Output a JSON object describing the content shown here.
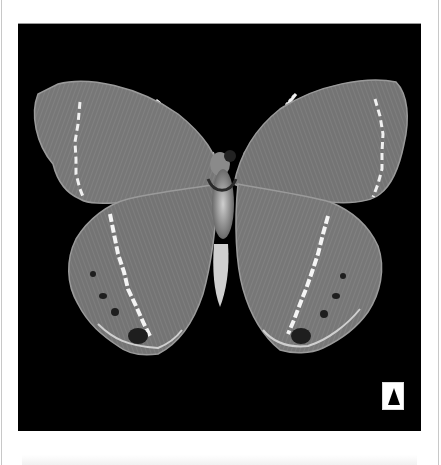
{
  "figure": {
    "background_color": "#000000",
    "page_color": "#ffffff",
    "wing_color": "#7a7a7a",
    "band_color": "#f2f2f2",
    "view_indicator": {
      "icon": "triangle-up-icon",
      "meaning": "dorsal/upper side marker"
    }
  }
}
